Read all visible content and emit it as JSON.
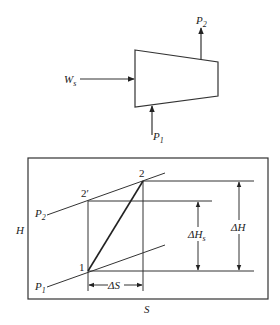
{
  "compressor": {
    "work_label": "W",
    "work_sub": "s",
    "inlet_label": "P",
    "inlet_sub": "1",
    "outlet_label": "P",
    "outlet_sub": "2"
  },
  "hs_diagram": {
    "y_axis_label": "H",
    "x_axis_label": "S",
    "isobar_high_label": "P",
    "isobar_high_sub": "2",
    "isobar_low_label": "P",
    "isobar_low_sub": "1",
    "point_1": "1",
    "point_2": "2",
    "point_2_prime": "2′",
    "delta_h_label": "ΔH",
    "delta_hs_label": "ΔH",
    "delta_hs_sub": "s",
    "delta_s_label": "ΔS"
  },
  "colors": {
    "line": "#333333",
    "background": "#ffffff"
  }
}
